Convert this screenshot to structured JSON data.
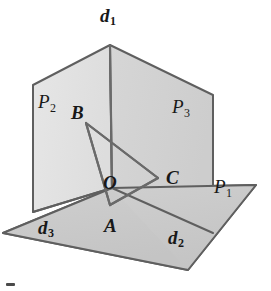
{
  "figure": {
    "background_color": "#ffffff",
    "stroke_color": "#5a5a5a",
    "label_color": "#181818",
    "width": 271,
    "height": 291
  },
  "planes": [
    {
      "id": "P1",
      "label_main": "P",
      "label_sub": "1",
      "role": "horizontal ground plane",
      "fill": "#c9c9c9",
      "label_x": 214,
      "label_y": 177
    },
    {
      "id": "P2",
      "label_main": "P",
      "label_sub": "2",
      "role": "left vertical half-plane",
      "fill": "#e2e2e2",
      "label_x": 38,
      "label_y": 92
    },
    {
      "id": "P3",
      "label_main": "P",
      "label_sub": "3",
      "role": "right vertical half-plane",
      "fill": "#d2d2d2",
      "label_x": 172,
      "label_y": 97
    }
  ],
  "edges": [
    {
      "id": "d1",
      "label_main": "d",
      "label_sub": "1",
      "role": "vertical intersection edge of P2 and P3",
      "label_x": 100,
      "label_y": 6
    },
    {
      "id": "d2",
      "label_main": "d",
      "label_sub": "2",
      "role": "intersection edge of P1 and P3",
      "label_x": 168,
      "label_y": 228
    },
    {
      "id": "d3",
      "label_main": "d",
      "label_sub": "3",
      "role": "intersection edge of P1 and P2",
      "label_x": 38,
      "label_y": 218
    }
  ],
  "points": [
    {
      "id": "A",
      "label": "A",
      "vertex_x": 110,
      "vertex_y": 205,
      "label_x": 104,
      "label_y": 216,
      "on": "P1"
    },
    {
      "id": "B",
      "label": "B",
      "vertex_x": 86,
      "vertex_y": 123,
      "label_x": 71,
      "label_y": 103,
      "on": "P2"
    },
    {
      "id": "C",
      "label": "C",
      "vertex_x": 158,
      "vertex_y": 178,
      "label_x": 166,
      "label_y": 168,
      "on": "P3"
    },
    {
      "id": "O",
      "label": "O",
      "vertex_x": 112,
      "vertex_y": 188,
      "label_x": 103,
      "label_y": 173,
      "on": "common vertex"
    }
  ],
  "geometry": {
    "apex": {
      "x": 110,
      "y": 45
    },
    "origin": {
      "x": 112,
      "y": 188
    },
    "ground_polygon": "3,233 112,188 256,185 188,270",
    "left_plane_polygon": "33,85 110,45 112,188 33,212",
    "right_plane_polygon": "110,45 213,95 213,233 112,188",
    "triangle": "86,123 158,178 110,205",
    "vertical_edge": {
      "x1": 110,
      "y1": 45,
      "x2": 112,
      "y2": 188
    }
  }
}
